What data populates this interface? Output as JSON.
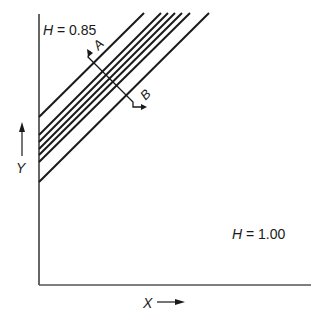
{
  "diagram": {
    "top_label": {
      "var": "H",
      "eq": " = 0.85"
    },
    "bottom_label": {
      "var": "H",
      "eq": " = 1.00"
    },
    "y_axis_label": "Y",
    "x_axis_label": "X",
    "section_labels": {
      "start": "A",
      "end": "B"
    },
    "line_count": 7,
    "colors": {
      "line": "#1a1a1a",
      "axis": "#555555",
      "background": "#ffffff"
    }
  }
}
